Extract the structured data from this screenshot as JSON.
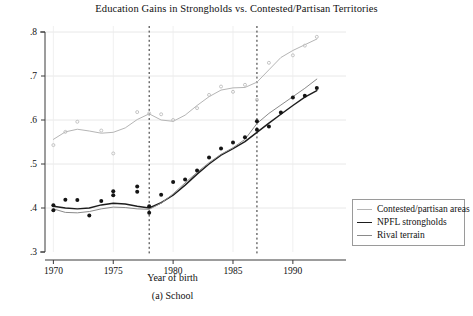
{
  "figure": {
    "title": "Education Gains in Strongholds vs. Contested/Partisan Territories",
    "xlabel": "Year of birth",
    "caption": "(a) School"
  },
  "legend": {
    "items": [
      {
        "label": "Contested/partisan areas",
        "color": "#b5b5b5",
        "width": 1.0
      },
      {
        "label": "NPFL strongholds",
        "color": "#1d1d1d",
        "width": 1.5
      },
      {
        "label": "Rival terrain",
        "color": "#8a8a8a",
        "width": 1.0
      }
    ]
  },
  "chart_data": {
    "type": "line",
    "title": "Education Gains in Strongholds vs. Contested/Partisan Territories",
    "xlabel": "Year of birth",
    "ylabel": "",
    "xlim": [
      1969.3,
      1992.6
    ],
    "ylim": [
      0.3,
      0.8
    ],
    "xticks": [
      1970,
      1975,
      1980,
      1985,
      1990
    ],
    "xticklabels": [
      "1970",
      "1975",
      "1980",
      "1985",
      "1990"
    ],
    "yticks": [
      0.3,
      0.4,
      0.5,
      0.6,
      0.7,
      0.8
    ],
    "yticklabels": [
      ".3",
      ".4",
      ".5",
      ".6",
      ".7",
      ".8"
    ],
    "grid": true,
    "grid_axis": "both",
    "legend_position": "outside-right-bottom",
    "vlines": [
      1978,
      1987
    ],
    "vline_style": "dashed",
    "series": [
      {
        "name": "Contested/partisan areas",
        "color": "#b5b5b5",
        "marker": "circle-open",
        "smoothed_line": {
          "x": [
            1970,
            1971,
            1972,
            1973,
            1974,
            1975,
            1976,
            1977,
            1978,
            1979,
            1980,
            1981,
            1982,
            1983,
            1984,
            1985,
            1986,
            1987,
            1988,
            1989,
            1990,
            1991,
            1992
          ],
          "y": [
            0.556,
            0.573,
            0.579,
            0.575,
            0.57,
            0.572,
            0.582,
            0.601,
            0.614,
            0.6,
            0.597,
            0.611,
            0.633,
            0.653,
            0.668,
            0.673,
            0.674,
            0.686,
            0.714,
            0.742,
            0.758,
            0.771,
            0.784
          ]
        },
        "points": {
          "x": [
            1970,
            1971,
            1972,
            1974,
            1975,
            1977,
            1978,
            1979,
            1980,
            1982,
            1983,
            1984,
            1985,
            1986,
            1987,
            1988,
            1990,
            1991,
            1992
          ],
          "y": [
            0.543,
            0.573,
            0.596,
            0.576,
            0.524,
            0.618,
            0.615,
            0.613,
            0.6,
            0.627,
            0.657,
            0.676,
            0.664,
            0.68,
            0.646,
            0.73,
            0.747,
            0.769,
            0.789
          ]
        }
      },
      {
        "name": "NPFL strongholds",
        "color": "#1d1d1d",
        "marker": "circle-filled",
        "smoothed_line": {
          "x": [
            1970,
            1971,
            1972,
            1973,
            1974,
            1975,
            1976,
            1977,
            1978,
            1979,
            1980,
            1981,
            1982,
            1983,
            1984,
            1985,
            1986,
            1987,
            1988,
            1989,
            1990,
            1991,
            1992
          ],
          "y": [
            0.404,
            0.4,
            0.398,
            0.4,
            0.407,
            0.411,
            0.409,
            0.404,
            0.4,
            0.412,
            0.429,
            0.452,
            0.477,
            0.5,
            0.52,
            0.535,
            0.551,
            0.572,
            0.593,
            0.613,
            0.633,
            0.652,
            0.667
          ]
        },
        "points": {
          "x": [
            1970,
            1970,
            1971,
            1972,
            1973,
            1974,
            1975,
            1975,
            1977,
            1977,
            1978,
            1978,
            1979,
            1980,
            1981,
            1982,
            1983,
            1984,
            1985,
            1986,
            1987,
            1987,
            1988,
            1989,
            1990,
            1991,
            1992
          ],
          "y": [
            0.406,
            0.395,
            0.419,
            0.418,
            0.383,
            0.416,
            0.438,
            0.429,
            0.449,
            0.437,
            0.404,
            0.389,
            0.43,
            0.459,
            0.465,
            0.485,
            0.515,
            0.535,
            0.549,
            0.561,
            0.597,
            0.578,
            0.585,
            0.617,
            0.651,
            0.655,
            0.673
          ]
        }
      },
      {
        "name": "Rival terrain",
        "color": "#8a8a8a",
        "marker": "none",
        "smoothed_line": {
          "x": [
            1970,
            1971,
            1972,
            1973,
            1974,
            1975,
            1976,
            1977,
            1978,
            1979,
            1980,
            1981,
            1982,
            1983,
            1984,
            1985,
            1986,
            1987,
            1988,
            1989,
            1990,
            1991,
            1992
          ],
          "y": [
            0.398,
            0.39,
            0.389,
            0.392,
            0.398,
            0.402,
            0.401,
            0.398,
            0.397,
            0.411,
            0.432,
            0.457,
            0.481,
            0.503,
            0.522,
            0.537,
            0.556,
            0.592,
            0.615,
            0.634,
            0.653,
            0.672,
            0.693
          ]
        },
        "points": {
          "x": [],
          "y": []
        }
      }
    ]
  }
}
